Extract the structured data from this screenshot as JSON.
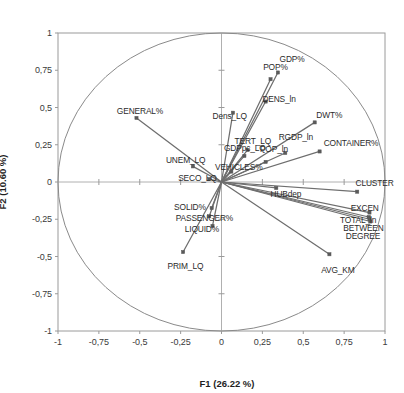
{
  "chart_data": {
    "type": "scatter",
    "subtype": "pca-correlation-circle-biplot",
    "title": "",
    "xlabel": "F1 (26.22 %)",
    "ylabel": "F2 (10.60 %)",
    "xlim": [
      -1,
      1
    ],
    "ylim": [
      -1,
      1
    ],
    "grid": false,
    "legend": "none",
    "unit_circle": true,
    "axis_lines": true,
    "xticks": [
      "-1",
      "-0,75",
      "-0,5",
      "-0,25",
      "0",
      "0,25",
      "0,5",
      "0,75",
      "1"
    ],
    "xtick_values": [
      -1,
      -0.75,
      -0.5,
      -0.25,
      0,
      0.25,
      0.5,
      0.75,
      1
    ],
    "yticks": [
      "1",
      "0,75",
      "0,5",
      "0,25",
      "0",
      "-0,25",
      "-0,5",
      "-0,75",
      "-1"
    ],
    "ytick_values": [
      1,
      0.75,
      0.5,
      0.25,
      0,
      -0.25,
      -0.5,
      -0.75,
      -1
    ],
    "variance_f1": "26.22 %",
    "variance_f2": "10.60 %",
    "vector_color": "#6e6e6e",
    "marker_color": "#5a5a5a",
    "circle_color": "#8a8a8a",
    "frame_color": "#9a9a9a",
    "points": [
      {
        "label": "GDP%",
        "x": 0.345,
        "y": 0.735,
        "lx": 0.355,
        "ly": 0.855,
        "anchor": "start"
      },
      {
        "label": "POP%",
        "x": 0.3,
        "y": 0.69,
        "lx": 0.255,
        "ly": 0.8,
        "anchor": "start"
      },
      {
        "label": "DENS_ln",
        "x": 0.27,
        "y": 0.54,
        "lx": 0.25,
        "ly": 0.585,
        "anchor": "start"
      },
      {
        "label": "Dens_LQ",
        "x": 0.07,
        "y": 0.465,
        "lx": -0.055,
        "ly": 0.47,
        "anchor": "start"
      },
      {
        "label": "DWT%",
        "x": 0.57,
        "y": 0.4,
        "lx": 0.58,
        "ly": 0.475,
        "anchor": "start"
      },
      {
        "label": "GENERAL%",
        "x": -0.52,
        "y": 0.43,
        "lx": -0.64,
        "ly": 0.505,
        "anchor": "start"
      },
      {
        "label": "CONTAINER%",
        "x": 0.6,
        "y": 0.205,
        "lx": 0.625,
        "ly": 0.29,
        "anchor": "start"
      },
      {
        "label": "RGDP_ln",
        "x": 0.39,
        "y": 0.195,
        "lx": 0.35,
        "ly": 0.33,
        "anchor": "start"
      },
      {
        "label": "TERT_LQ",
        "x": 0.16,
        "y": 0.215,
        "lx": 0.08,
        "ly": 0.305,
        "anchor": "start"
      },
      {
        "label": "GDPpc_LQ",
        "x": 0.14,
        "y": 0.175,
        "lx": 0.015,
        "ly": 0.255,
        "anchor": "start"
      },
      {
        "label": "POP_ln",
        "x": 0.27,
        "y": 0.135,
        "lx": 0.235,
        "ly": 0.25,
        "anchor": "start"
      },
      {
        "label": "UNEM_LQ",
        "x": -0.175,
        "y": 0.105,
        "lx": -0.34,
        "ly": 0.175,
        "anchor": "start"
      },
      {
        "label": "VEHICLES%",
        "x": 0.06,
        "y": 0.07,
        "lx": -0.04,
        "ly": 0.13,
        "anchor": "start"
      },
      {
        "label": "SECO_LQ",
        "x": -0.075,
        "y": 0.02,
        "lx": -0.265,
        "ly": 0.055,
        "anchor": "start"
      },
      {
        "label": "HUBdep",
        "x": 0.335,
        "y": -0.04,
        "lx": 0.3,
        "ly": -0.055,
        "anchor": "start"
      },
      {
        "label": "CLUSTER",
        "x": 0.83,
        "y": -0.065,
        "lx": 0.82,
        "ly": 0.02,
        "anchor": "start"
      },
      {
        "label": "EXCEN",
        "x": 0.905,
        "y": -0.205,
        "lx": 0.79,
        "ly": -0.145,
        "anchor": "start"
      },
      {
        "label": "TOTAL_ln",
        "x": 0.9,
        "y": -0.235,
        "lx": 0.725,
        "ly": -0.23,
        "anchor": "start"
      },
      {
        "label": "BETWEEN",
        "x": 0.905,
        "y": -0.25,
        "lx": 0.745,
        "ly": -0.285,
        "anchor": "start"
      },
      {
        "label": "DEGREE",
        "x": 0.91,
        "y": -0.265,
        "lx": 0.76,
        "ly": -0.335,
        "anchor": "start"
      },
      {
        "label": "SOLID%",
        "x": -0.06,
        "y": -0.175,
        "lx": -0.29,
        "ly": -0.14,
        "anchor": "start"
      },
      {
        "label": "PASSENGER%",
        "x": -0.075,
        "y": -0.23,
        "lx": -0.28,
        "ly": -0.215,
        "anchor": "start"
      },
      {
        "label": "LIQUID%",
        "x": -0.055,
        "y": -0.295,
        "lx": -0.225,
        "ly": -0.29,
        "anchor": "start"
      },
      {
        "label": "PRIM_LQ",
        "x": -0.235,
        "y": -0.47,
        "lx": -0.33,
        "ly": -0.54,
        "anchor": "start"
      },
      {
        "label": "AVG_KM",
        "x": 0.66,
        "y": -0.485,
        "lx": 0.61,
        "ly": -0.565,
        "anchor": "start"
      }
    ]
  }
}
